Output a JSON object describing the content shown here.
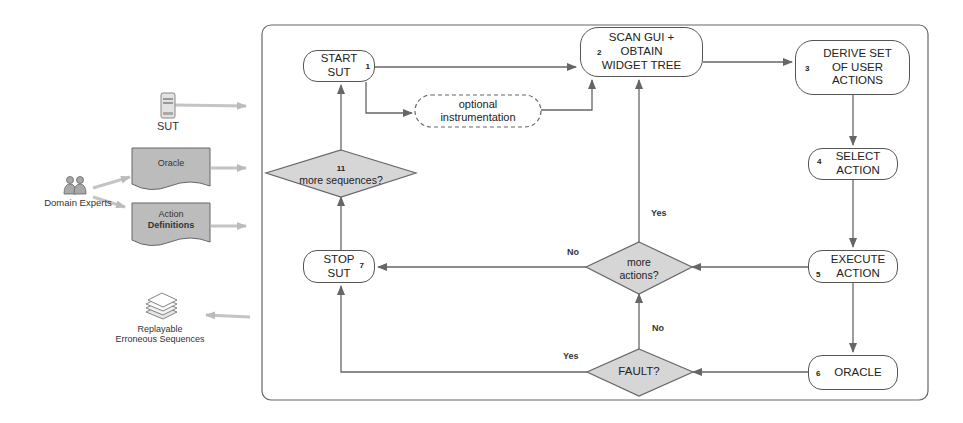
{
  "inputs": {
    "sut": {
      "label": "SUT",
      "icon": "server-icon"
    },
    "oracle": {
      "label": "Oracle",
      "icon": "document-icon"
    },
    "domain_experts": {
      "label": "Domain Experts",
      "icon": "people-icon"
    },
    "action_definitions": {
      "line1": "Action",
      "line2": "Definitions",
      "icon": "document-icon"
    }
  },
  "outputs": {
    "replayable": {
      "line1": "Replayable",
      "line2": "Erroneous Sequences",
      "icon": "stacked-pages-icon"
    }
  },
  "flow": {
    "start_sut": {
      "num": "1",
      "line1": "START",
      "line2": "SUT"
    },
    "optional_instrumentation": {
      "line1": "optional",
      "line2": "instrumentation"
    },
    "scan_gui": {
      "num": "2",
      "line1": "SCAN GUI +",
      "line2": "OBTAIN",
      "line3": "WIDGET TREE"
    },
    "derive_set": {
      "num": "3",
      "line1": "DERIVE SET",
      "line2": "OF USER",
      "line3": "ACTIONS"
    },
    "select_action": {
      "num": "4",
      "line1": "SELECT",
      "line2": "ACTION"
    },
    "execute_action": {
      "num": "5",
      "line1": "EXECUTE",
      "line2": "ACTION"
    },
    "oracle": {
      "num": "6",
      "line1": "ORACLE"
    },
    "stop_sut": {
      "num": "7",
      "line1": "STOP",
      "line2": "SUT"
    },
    "more_actions": {
      "line1": "more",
      "line2": "actions?"
    },
    "fault": {
      "line1": "FAULT?"
    },
    "more_sequences": {
      "num": "11",
      "line1": "more sequences?"
    }
  },
  "edge_labels": {
    "more_actions_yes": "Yes",
    "more_actions_no": "No",
    "fault_yes": "Yes",
    "fault_no": "No"
  },
  "colors": {
    "diamond_fill": "#d6d6d6",
    "doc_fill": "#b8b8b8",
    "stroke": "#555555"
  }
}
